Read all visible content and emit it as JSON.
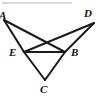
{
  "figure": {
    "canvas": {
      "width": 102,
      "height": 100
    },
    "stroke_color": "#1a1a1a",
    "label_color": "#111111",
    "background_color": "#ffffff",
    "rule_color": "#d9d9d9",
    "top_rule": {
      "x1": 2,
      "y1": 3,
      "x2": 72,
      "y2": 3
    },
    "points": [
      {
        "id": "A",
        "label": "A",
        "x": 4,
        "y": 20,
        "label_x": -1,
        "label_y": 10
      },
      {
        "id": "D",
        "label": "D",
        "x": 94,
        "y": 23,
        "label_x": 84,
        "label_y": 8
      },
      {
        "id": "E",
        "label": "E",
        "x": 24,
        "y": 52,
        "label_x": 9,
        "label_y": 47
      },
      {
        "id": "B",
        "label": "B",
        "x": 65,
        "y": 52,
        "label_x": 71,
        "label_y": 47
      },
      {
        "id": "C",
        "label": "C",
        "x": 45,
        "y": 80,
        "label_x": 40,
        "label_y": 84
      }
    ],
    "segments": [
      {
        "id": "AE",
        "from": "A",
        "to": "E",
        "label": "segment A to E"
      },
      {
        "id": "AB",
        "from": "A",
        "to": "B",
        "label": "segment A to B"
      },
      {
        "id": "DE",
        "from": "D",
        "to": "E",
        "label": "segment D to E"
      },
      {
        "id": "DB",
        "from": "D",
        "to": "B",
        "label": "segment D to B"
      },
      {
        "id": "EB",
        "from": "E",
        "to": "B",
        "label": "segment E to B"
      },
      {
        "id": "EC",
        "from": "E",
        "to": "C",
        "label": "segment E to C"
      },
      {
        "id": "BC",
        "from": "B",
        "to": "C",
        "label": "segment B to C"
      }
    ]
  }
}
